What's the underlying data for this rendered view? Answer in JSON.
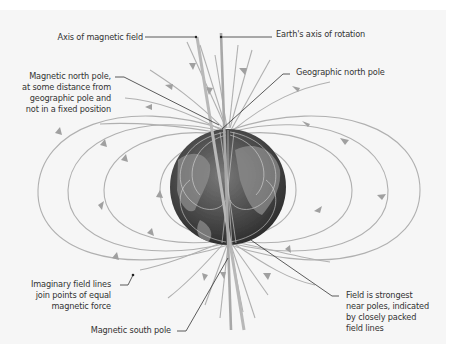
{
  "diagram": {
    "colors": {
      "background": "#ffffff",
      "panel": "#f6f6f6",
      "field_line": "#a8a8a8",
      "leader_line": "#333333",
      "text": "#333333",
      "globe": "#4a4a4a"
    },
    "labels": {
      "axis_magnetic": "Axis of magnetic field",
      "axis_rotation": "Earth's axis of rotation",
      "magnetic_north_1": "Magnetic north pole,",
      "magnetic_north_2": "at some distance from",
      "magnetic_north_3": "geographic pole and",
      "magnetic_north_4": "not in a fixed position",
      "geographic_north": "Geographic north pole",
      "field_lines_1": "Imaginary field lines",
      "field_lines_2": "join points of equal",
      "field_lines_3": "magnetic force",
      "magnetic_south": "Magnetic south pole",
      "strongest_1": "Field is strongest",
      "strongest_2": "near poles, indicated",
      "strongest_3": "by closely packed",
      "strongest_4": "field lines"
    },
    "elements": [
      "globe-earth",
      "magnetic-axis",
      "rotation-axis",
      "field-lines",
      "arrow-heads"
    ]
  }
}
